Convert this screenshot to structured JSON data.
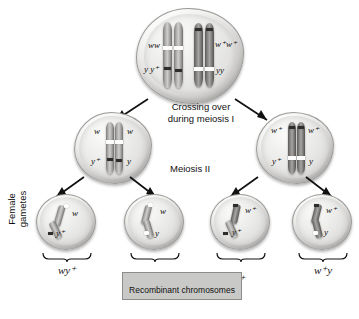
{
  "diagram": {
    "side_label": {
      "line1": "Female",
      "line2": "gametes"
    },
    "captions": {
      "crossing_over_line1": "Crossing over",
      "crossing_over_line2": "during meiosis I",
      "meiosis_ii": "Meiosis II",
      "recombinant": "Recombinant chromosomes"
    },
    "parent_cell": {
      "name": "parent-cell",
      "labels": {
        "top_left": "ww",
        "top_right": "w⁺w⁺",
        "bottom_left": "y y⁺",
        "bottom_right": "yy"
      }
    },
    "meiosis_i_cells": [
      {
        "name": "meiosis-i-cell-left",
        "labels": {
          "top_left": "w",
          "top_right": "w",
          "bottom_left": "y⁺",
          "bottom_right": "y"
        }
      },
      {
        "name": "meiosis-i-cell-right",
        "labels": {
          "top_left": "w⁺",
          "top_right": "w⁺",
          "bottom_left": "y⁺",
          "bottom_right": "y"
        }
      }
    ],
    "gametes": [
      {
        "name": "gamete-1",
        "allele_w": "w",
        "allele_y": "y⁺",
        "genotype": "wy⁺",
        "recombinant": false
      },
      {
        "name": "gamete-2",
        "allele_w": "w",
        "allele_y": "y",
        "genotype": "wy",
        "recombinant": true
      },
      {
        "name": "gamete-3",
        "allele_w": "w⁺",
        "allele_y": "y⁺",
        "genotype": "w⁺y⁺",
        "recombinant": true
      },
      {
        "name": "gamete-4",
        "allele_w": "w⁺",
        "allele_y": "y",
        "genotype": "w⁺y",
        "recombinant": false
      }
    ],
    "colors": {
      "background": "#ffffff",
      "cell_fill": "#e8e7e5",
      "cell_outline": "#9b9a98",
      "chromosome": "#8d8c8a",
      "recombinant_box": "#c9c9c7",
      "text": "#111111"
    }
  }
}
